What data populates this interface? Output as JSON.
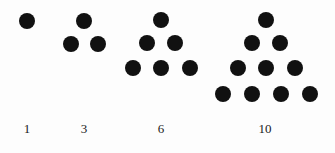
{
  "figure": {
    "background_color": "#fdfdfd",
    "dot_color": "#111111",
    "label_color": "#1a1a1a",
    "dot_radius": 8,
    "width": 335,
    "height": 153
  },
  "groups": [
    {
      "name": "triangular-number-1",
      "label": "1",
      "label_x": 27,
      "label_y": 122,
      "rows": 1,
      "dot_count": 1,
      "dots": [
        {
          "cx": 27,
          "cy": 21
        }
      ]
    },
    {
      "name": "triangular-number-3",
      "label": "3",
      "label_x": 84,
      "label_y": 122,
      "rows": 2,
      "dot_count": 3,
      "dots": [
        {
          "cx": 84,
          "cy": 21
        },
        {
          "cx": 71,
          "cy": 44
        },
        {
          "cx": 98,
          "cy": 44
        }
      ]
    },
    {
      "name": "triangular-number-6",
      "label": "6",
      "label_x": 161,
      "label_y": 122,
      "rows": 3,
      "dot_count": 6,
      "dots": [
        {
          "cx": 161,
          "cy": 20
        },
        {
          "cx": 147,
          "cy": 43
        },
        {
          "cx": 175,
          "cy": 43
        },
        {
          "cx": 133,
          "cy": 68
        },
        {
          "cx": 161,
          "cy": 68
        },
        {
          "cx": 190,
          "cy": 68
        }
      ]
    },
    {
      "name": "triangular-number-10",
      "label": "10",
      "label_x": 265,
      "label_y": 122,
      "rows": 4,
      "dot_count": 10,
      "dots": [
        {
          "cx": 266,
          "cy": 20
        },
        {
          "cx": 252,
          "cy": 43
        },
        {
          "cx": 280,
          "cy": 43
        },
        {
          "cx": 238,
          "cy": 68
        },
        {
          "cx": 266,
          "cy": 68
        },
        {
          "cx": 295,
          "cy": 68
        },
        {
          "cx": 223,
          "cy": 94
        },
        {
          "cx": 252,
          "cy": 94
        },
        {
          "cx": 281,
          "cy": 94
        },
        {
          "cx": 310,
          "cy": 94
        }
      ]
    }
  ],
  "chart_data": {
    "type": "scatter",
    "categories": [
      "1",
      "3",
      "6",
      "10"
    ],
    "values": [
      1,
      3,
      6,
      10
    ],
    "xlabel": "",
    "ylabel": "",
    "grid": false,
    "legend": "none"
  }
}
